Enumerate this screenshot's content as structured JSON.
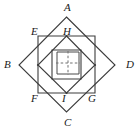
{
  "figure": {
    "stroke_color": "#3c3c3c",
    "dashed_color": "#6e6e6e",
    "background_color": "#ffffff",
    "label_color": "#1a1a1a"
  },
  "labels": {
    "A": "A",
    "B": "B",
    "C": "C",
    "D": "D",
    "E": "E",
    "F": "F",
    "G": "G",
    "H": "H",
    "I": "I"
  },
  "label_positions": {
    "A": {
      "x": 64,
      "y": 2
    },
    "B": {
      "x": 4,
      "y": 59
    },
    "C": {
      "x": 64,
      "y": 117
    },
    "D": {
      "x": 126,
      "y": 59
    },
    "E": {
      "x": 31,
      "y": 27
    },
    "F": {
      "x": 31,
      "y": 93
    },
    "G": {
      "x": 88,
      "y": 93
    },
    "H": {
      "x": 63,
      "y": 27
    },
    "I": {
      "x": 62,
      "y": 93
    }
  },
  "geometry": {
    "center": {
      "x": 66.5,
      "y": 65
    },
    "outer_diamond_ABCD": {
      "A": {
        "x": 66.5,
        "y": 17
      },
      "B": {
        "x": 19,
        "y": 65
      },
      "C": {
        "x": 66.5,
        "y": 112
      },
      "D": {
        "x": 115,
        "y": 65
      }
    },
    "square_EFGH": {
      "E": {
        "x": 38,
        "y": 36
      },
      "H_top_right": {
        "x": 95,
        "y": 36
      },
      "G": {
        "x": 95,
        "y": 93
      },
      "F": {
        "x": 38,
        "y": 93
      }
    },
    "mid_diamond": {
      "top": {
        "x": 66.5,
        "y": 36
      },
      "right": {
        "x": 95,
        "y": 65
      },
      "bottom": {
        "x": 66.5,
        "y": 93
      },
      "left": {
        "x": 38,
        "y": 65
      }
    },
    "inner_square": {
      "top_left": {
        "x": 52,
        "y": 50
      },
      "top_right": {
        "x": 81,
        "y": 50
      },
      "bottom_right": {
        "x": 81,
        "y": 79
      },
      "bottom_left": {
        "x": 52,
        "y": 79
      }
    },
    "innermost_square": {
      "top_left": {
        "x": 57,
        "y": 52
      },
      "top_right": {
        "x": 79,
        "y": 52
      },
      "bottom_right": {
        "x": 79,
        "y": 74
      },
      "bottom_left": {
        "x": 57,
        "y": 74
      }
    },
    "dashed_cross": {
      "vertical": {
        "x": 68,
        "y1": 52,
        "y2": 74
      },
      "horizontal": {
        "y": 63,
        "x1": 57,
        "x2": 79
      }
    }
  }
}
